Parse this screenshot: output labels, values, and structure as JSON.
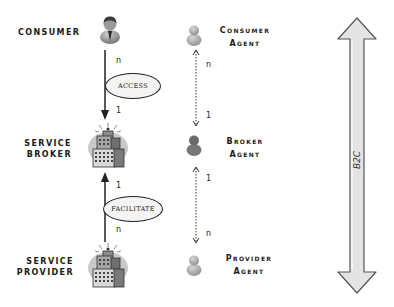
{
  "left_column": {
    "consumer": {
      "label": "CONSUMER",
      "icon": "person-icon"
    },
    "broker": {
      "label_line1": "SERVICE",
      "label_line2": "BROKER",
      "icon": "building-icon"
    },
    "provider": {
      "label_line1": "SERVICE",
      "label_line2": "PROVIDER",
      "icon": "building-icon"
    }
  },
  "relations": {
    "access": {
      "label": "ACCESS",
      "from_mult": "n",
      "to_mult": "1",
      "direction": "down"
    },
    "facilitate": {
      "label": "FACILITATE",
      "from_mult": "n",
      "to_mult": "1",
      "direction": "up"
    }
  },
  "agents": {
    "consumer_agent": {
      "line1": "Consumer",
      "line2": "Agent",
      "icon": "person-icon"
    },
    "broker_agent": {
      "line1": "Broker",
      "line2": "Agent",
      "icon": "person-icon"
    },
    "provider_agent": {
      "line1": "Provider",
      "line2": "Agent",
      "icon": "person-icon"
    }
  },
  "agent_links": {
    "upper": {
      "top_mult": "n",
      "bottom_mult": "1"
    },
    "lower": {
      "top_mult": "1",
      "bottom_mult": "n"
    }
  },
  "scope_arrow": {
    "label": "B2C"
  },
  "colors": {
    "line": "#222222",
    "arrow_fill": "#e4e4e4",
    "arrow_stroke": "#555555",
    "halo": "#c9c9c9"
  }
}
